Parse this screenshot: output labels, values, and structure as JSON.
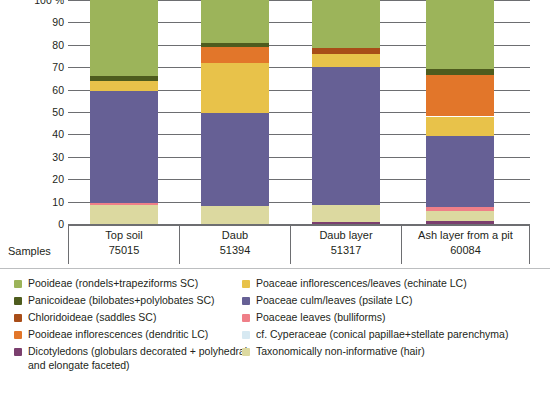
{
  "chart_data": {
    "type": "bar",
    "stacked": true,
    "title": "",
    "xlabel": "",
    "ylabel": "100 %",
    "ylim": [
      0,
      100
    ],
    "yticks": [
      "100 %",
      "90",
      "80",
      "70",
      "60",
      "50",
      "40",
      "30",
      "20",
      "10",
      "0"
    ],
    "grid": true,
    "legend_position": "bottom",
    "categories": [
      "Top soil",
      "Daub",
      "Daub layer",
      "Ash layer from a pit"
    ],
    "sample_counts": [
      "75015",
      "51394",
      "51317",
      "60084"
    ],
    "series": [
      {
        "name": "Pooideae (rondels+trapeziforms SC)",
        "key": "pooideae_sc",
        "color": "#9cb45a",
        "values": [
          34.0,
          19.0,
          21.5,
          31.0
        ]
      },
      {
        "name": "Panicoideae (bilobates+polylobates SC)",
        "key": "panicoideae_sc",
        "color": "#4e5c1e",
        "values": [
          2.0,
          2.0,
          0.0,
          2.5
        ]
      },
      {
        "name": "Chloridoideae (saddles SC)",
        "key": "chloridoideae_sc",
        "color": "#a84d18",
        "values": [
          0.0,
          0.0,
          2.5,
          0.0
        ]
      },
      {
        "name": "Pooideae inflorescences (dendritic LC)",
        "key": "pooideae_lc",
        "color": "#e2762a",
        "values": [
          0.0,
          7.0,
          0.0,
          18.5
        ]
      },
      {
        "name": "Dicotyledons (globulars decorated + polyhedral and elongate faceted)",
        "key": "dicotyledons",
        "color": "#7b3f6e",
        "values": [
          0.0,
          0.0,
          1.0,
          1.5
        ]
      },
      {
        "name": "Poaceae inflorescences/leaves (echinate LC)",
        "key": "poaceae_echinate",
        "color": "#e8c24a",
        "values": [
          4.5,
          22.5,
          6.0,
          8.5
        ]
      },
      {
        "name": "Poaceae culm/leaves (psilate LC)",
        "key": "poaceae_psilate",
        "color": "#666095",
        "values": [
          50.0,
          41.5,
          61.5,
          32.0
        ]
      },
      {
        "name": "Poaceae leaves (bulliforms)",
        "key": "poaceae_bulliform",
        "color": "#ef7f88",
        "values": [
          1.0,
          0.0,
          0.0,
          1.5
        ]
      },
      {
        "name": "cf. Cyperaceae (conical papillae+stellate parenchyma)",
        "key": "cyperaceae",
        "color": "#d7e9f2",
        "values": [
          0.0,
          0.0,
          0.0,
          0.0
        ]
      },
      {
        "name": "Taxonomically non-informative (hair)",
        "key": "hair",
        "color": "#dcd9a0",
        "values": [
          8.5,
          8.0,
          7.5,
          4.5
        ]
      }
    ],
    "stack_order_bottom_to_top": [
      "dicotyledons",
      "hair",
      "poaceae_bulliform",
      "poaceae_psilate",
      "poaceae_echinate",
      "pooideae_lc",
      "chloridoideae_sc",
      "panicoideae_sc",
      "pooideae_sc"
    ]
  },
  "axis": {
    "samples_row_label": "Samples"
  },
  "legend": {
    "left_column": [
      {
        "label": "Pooideae (rondels+trapeziforms SC)",
        "color": "#9cb45a",
        "swatch_name": "legend-swatch-pooideae-sc"
      },
      {
        "label": "Panicoideae (bilobates+polylobates SC)",
        "color": "#4e5c1e",
        "swatch_name": "legend-swatch-panicoideae-sc"
      },
      {
        "label": "Chloridoideae (saddles SC)",
        "color": "#a84d18",
        "swatch_name": "legend-swatch-chloridoideae-sc"
      },
      {
        "label": "Pooideae inflorescences (dendritic LC)",
        "color": "#e2762a",
        "swatch_name": "legend-swatch-pooideae-lc"
      },
      {
        "label": "Dicotyledons (globulars decorated + polyhedral and elongate faceted)",
        "color": "#7b3f6e",
        "swatch_name": "legend-swatch-dicotyledons"
      }
    ],
    "right_column": [
      {
        "label": "Poaceae inflorescences/leaves (echinate LC)",
        "color": "#e8c24a",
        "swatch_name": "legend-swatch-poaceae-echinate"
      },
      {
        "label": "Poaceae culm/leaves (psilate LC)",
        "color": "#666095",
        "swatch_name": "legend-swatch-poaceae-psilate"
      },
      {
        "label": "Poaceae leaves (bulliforms)",
        "color": "#ef7f88",
        "swatch_name": "legend-swatch-poaceae-bulliform"
      },
      {
        "label": "cf. Cyperaceae (conical papillae+stellate parenchyma)",
        "color": "#d7e9f2",
        "swatch_name": "legend-swatch-cyperaceae"
      },
      {
        "label": "Taxonomically non-informative (hair)",
        "color": "#dcd9a0",
        "swatch_name": "legend-swatch-hair"
      }
    ]
  }
}
